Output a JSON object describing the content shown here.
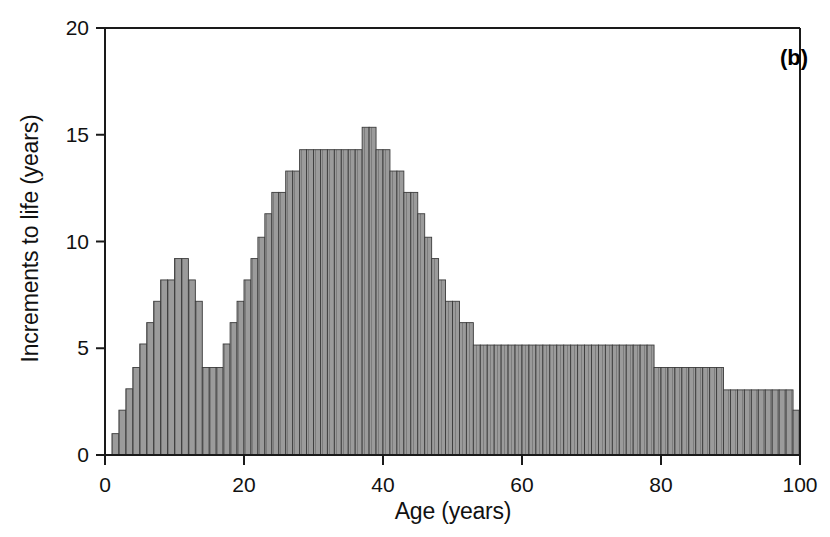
{
  "panel": {
    "label": "(b)"
  },
  "axes": {
    "x_title": "Age (years)",
    "y_title": "Increments to life (years)",
    "x_ticks": [
      "0",
      "20",
      "40",
      "60",
      "80",
      "100"
    ],
    "y_ticks": [
      "0",
      "5",
      "10",
      "15",
      "20"
    ]
  },
  "style": {
    "bar_fill": "#9b9b9b",
    "bar_edge": "#3b3b3b",
    "axis_color": "#1a1a1a",
    "background": "#ffffff"
  },
  "chart_data": {
    "type": "bar",
    "title": "",
    "subtitle": "",
    "annotations": [
      "(b)"
    ],
    "xlabel": "Age (years)",
    "ylabel": "Increments to life (years)",
    "xlim": [
      0,
      100
    ],
    "ylim": [
      0,
      20
    ],
    "xticks": [
      0,
      20,
      40,
      60,
      80,
      100
    ],
    "yticks": [
      0,
      5,
      10,
      15,
      20
    ],
    "grid": false,
    "legend": null,
    "bin_width": 1,
    "x": [
      1,
      2,
      3,
      4,
      5,
      6,
      7,
      8,
      9,
      10,
      11,
      12,
      13,
      14,
      15,
      16,
      17,
      18,
      19,
      20,
      21,
      22,
      23,
      24,
      25,
      26,
      27,
      28,
      29,
      30,
      31,
      32,
      33,
      34,
      35,
      36,
      37,
      38,
      39,
      40,
      41,
      42,
      43,
      44,
      45,
      46,
      47,
      48,
      49,
      50,
      51,
      52,
      53,
      54,
      55,
      56,
      57,
      58,
      59,
      60,
      61,
      62,
      63,
      64,
      65,
      66,
      67,
      68,
      69,
      70,
      71,
      72,
      73,
      74,
      75,
      76,
      77,
      78,
      79,
      80,
      81,
      82,
      83,
      84,
      85,
      86,
      87,
      88,
      89,
      90,
      91,
      92,
      93,
      94,
      95,
      96,
      97,
      98,
      99
    ],
    "categories": [
      "1",
      "2",
      "3",
      "4",
      "5",
      "6",
      "7",
      "8",
      "9",
      "10",
      "11",
      "12",
      "13",
      "14",
      "15",
      "16",
      "17",
      "18",
      "19",
      "20",
      "21",
      "22",
      "23",
      "24",
      "25",
      "26",
      "27",
      "28",
      "29",
      "30",
      "31",
      "32",
      "33",
      "34",
      "35",
      "36",
      "37",
      "38",
      "39",
      "40",
      "41",
      "42",
      "43",
      "44",
      "45",
      "46",
      "47",
      "48",
      "49",
      "50",
      "51",
      "52",
      "53",
      "54",
      "55",
      "56",
      "57",
      "58",
      "59",
      "60",
      "61",
      "62",
      "63",
      "64",
      "65",
      "66",
      "67",
      "68",
      "69",
      "70",
      "71",
      "72",
      "73",
      "74",
      "75",
      "76",
      "77",
      "78",
      "79",
      "80",
      "81",
      "82",
      "83",
      "84",
      "85",
      "86",
      "87",
      "88",
      "89",
      "90",
      "91",
      "92",
      "93",
      "94",
      "95",
      "96",
      "97",
      "98",
      "99"
    ],
    "values": [
      1.0,
      2.1,
      3.1,
      4.1,
      5.2,
      6.2,
      7.2,
      8.2,
      8.2,
      9.2,
      9.2,
      8.2,
      7.2,
      4.1,
      4.1,
      4.1,
      5.2,
      6.2,
      7.2,
      8.2,
      9.2,
      10.2,
      11.3,
      12.3,
      12.3,
      13.3,
      13.3,
      14.3,
      14.3,
      14.3,
      14.3,
      14.3,
      14.3,
      14.3,
      14.3,
      14.3,
      15.35,
      15.35,
      14.3,
      14.3,
      13.3,
      13.3,
      12.3,
      12.3,
      11.3,
      10.2,
      9.2,
      8.2,
      7.2,
      7.2,
      6.2,
      6.2,
      5.15,
      5.15,
      5.15,
      5.15,
      5.15,
      5.15,
      5.15,
      5.15,
      5.15,
      5.15,
      5.15,
      5.15,
      5.15,
      5.15,
      5.15,
      5.15,
      5.15,
      5.15,
      5.15,
      5.15,
      5.15,
      5.15,
      5.15,
      5.15,
      5.15,
      5.15,
      4.1,
      4.1,
      4.1,
      4.1,
      4.1,
      4.1,
      4.1,
      4.1,
      4.1,
      4.1,
      3.05,
      3.05,
      3.05,
      3.05,
      3.05,
      3.05,
      3.05,
      3.05,
      3.05,
      3.05,
      2.1
    ]
  }
}
